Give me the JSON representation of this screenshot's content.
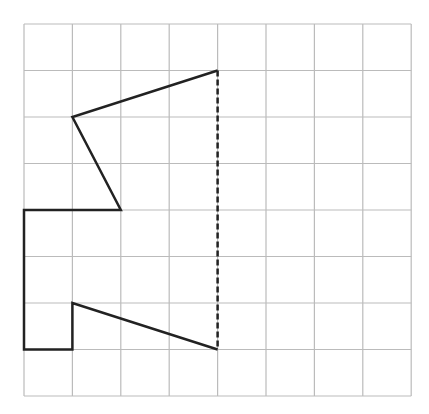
{
  "figure": {
    "grid": {
      "columns": 8,
      "rows": 8,
      "origin_x": 24,
      "origin_y": 24,
      "cell_w": 48.4,
      "cell_h": 46.5,
      "line_color": "#bbbbbb"
    },
    "shape": {
      "stroke_color": "#222222",
      "vertices": [
        [
          4,
          1
        ],
        [
          1,
          2
        ],
        [
          2,
          4
        ],
        [
          0,
          4
        ],
        [
          0,
          7
        ],
        [
          1,
          7
        ],
        [
          1,
          6
        ],
        [
          4,
          7
        ]
      ]
    },
    "symmetry_line": {
      "style": "dashed",
      "color": "#222222",
      "from": [
        4,
        1
      ],
      "to": [
        4,
        7
      ]
    }
  }
}
